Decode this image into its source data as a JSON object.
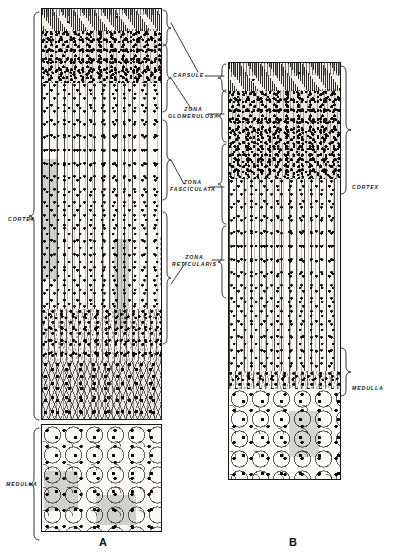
{
  "figure": {
    "plate_labels": [
      {
        "text": "A",
        "x": 103,
        "y": 538
      },
      {
        "text": "B",
        "x": 293,
        "y": 538
      }
    ],
    "zone_labels": [
      {
        "id": "capsule",
        "text": "CAPSULE",
        "x": 173,
        "y": 76
      },
      {
        "id": "glomerulosa",
        "text": "ZONA\nGLOMERULOSA",
        "x": 173,
        "y": 113
      },
      {
        "id": "fasciculata",
        "text": "ZONA\nFASCICULATA",
        "x": 175,
        "y": 185
      },
      {
        "id": "reticularis",
        "text": "ZONA\nRETICULARIS",
        "x": 177,
        "y": 258
      }
    ],
    "side_labels": [
      {
        "id": "cortex-a",
        "text": "CORTEX",
        "x": 8,
        "y": 219,
        "align": "left"
      },
      {
        "id": "medulla-a",
        "text": "MEDULLA",
        "x": 8,
        "y": 484,
        "align": "left"
      },
      {
        "id": "cortex-b",
        "text": "CORTEX",
        "x": 351,
        "y": 187,
        "align": "right"
      },
      {
        "id": "medulla-b",
        "text": "MEDULLA",
        "x": 351,
        "y": 388,
        "align": "right"
      }
    ],
    "specimens": [
      {
        "id": "specimen-a",
        "plate": "A",
        "panels": [
          {
            "id": "a-cortex",
            "x": 41,
            "y": 8,
            "w": 119,
            "h": 410
          },
          {
            "id": "a-medulla",
            "x": 41,
            "y": 424,
            "w": 119,
            "h": 106
          }
        ],
        "bands": [
          {
            "id": "a-capsule",
            "zone": "capsule",
            "top": 0,
            "height": 22
          },
          {
            "id": "a-glomerulosa",
            "zone": "glomerulosa",
            "top": 22,
            "height": 52
          },
          {
            "id": "a-fasciculata",
            "zone": "fasciculata",
            "top": 74,
            "height": 226
          },
          {
            "id": "a-reticularis",
            "zone": "reticularis",
            "top": 300,
            "height": 52
          },
          {
            "id": "a-branching",
            "zone": "reticularis-deep",
            "top": 352,
            "height": 58
          }
        ]
      },
      {
        "id": "specimen-b",
        "plate": "B",
        "panels": [
          {
            "id": "b-column",
            "x": 228,
            "y": 62,
            "w": 111,
            "h": 416
          }
        ],
        "bands": [
          {
            "id": "b-capsule",
            "zone": "capsule",
            "top": 0,
            "height": 28
          },
          {
            "id": "b-glomerulosa",
            "zone": "glomerulosa",
            "top": 28,
            "height": 88
          },
          {
            "id": "b-fasciculata",
            "zone": "fasciculata",
            "top": 116,
            "height": 192
          },
          {
            "id": "b-reticularis",
            "zone": "reticularis",
            "top": 308,
            "height": 18
          },
          {
            "id": "b-medulla",
            "zone": "medulla",
            "top": 326,
            "height": 88
          }
        ]
      }
    ],
    "colors": {
      "ink": "#141414",
      "paper": "#ffffff",
      "tissue_light": "#fbfaf6",
      "tissue_dark": "#e8e7e1"
    }
  }
}
